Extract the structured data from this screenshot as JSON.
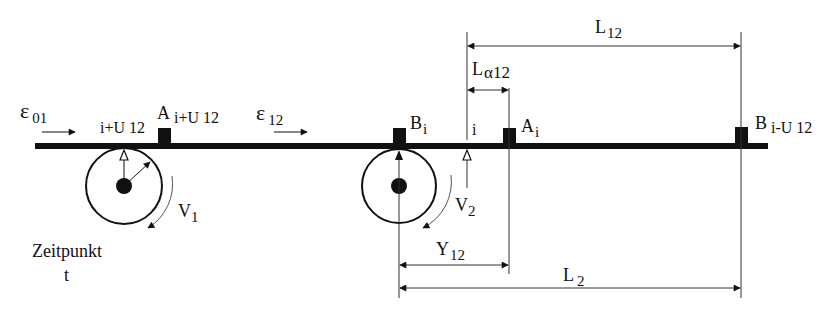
{
  "diagram": {
    "type": "belt-conveyor-schematic",
    "colors": {
      "line": "#111111",
      "thin_line": "#555555",
      "background": "#ffffff"
    },
    "labels": {
      "strain_01": {
        "main": "ε",
        "sub": "01"
      },
      "strain_12": {
        "main": "ε",
        "sub": "12"
      },
      "marker_A_iU12": {
        "main": "A",
        "sub": "i+U 12"
      },
      "marker_B_i": {
        "main": "B",
        "sub": "i"
      },
      "marker_A_i": {
        "main": "A",
        "sub": "i"
      },
      "marker_B_iU12": {
        "main": "B",
        "sub": "i-U 12"
      },
      "point_iU12": "i+U 12",
      "point_i": "i",
      "velocity_1": {
        "main": "V",
        "sub": "1"
      },
      "velocity_2": {
        "main": "V",
        "sub": "2"
      },
      "time_line1": "Zeitpunkt",
      "time_line2": "t",
      "dim_L12": {
        "main": "L",
        "sub": "12"
      },
      "dim_La12": {
        "main": "L",
        "sub": "α12"
      },
      "dim_Y12": {
        "main": "Y",
        "sub": "12"
      },
      "dim_L2": {
        "main": "L",
        "sub": "2"
      }
    },
    "geometry": {
      "belt": {
        "x1": 35,
        "x2": 768,
        "y": 146,
        "thickness": 6
      },
      "roller_1": {
        "cx": 124,
        "cy": 186,
        "r": 38,
        "hub_r": 8
      },
      "roller_2": {
        "cx": 399,
        "cy": 186,
        "r": 37,
        "hub_r": 8
      },
      "markers_x": [
        164,
        399,
        509,
        741
      ]
    }
  }
}
